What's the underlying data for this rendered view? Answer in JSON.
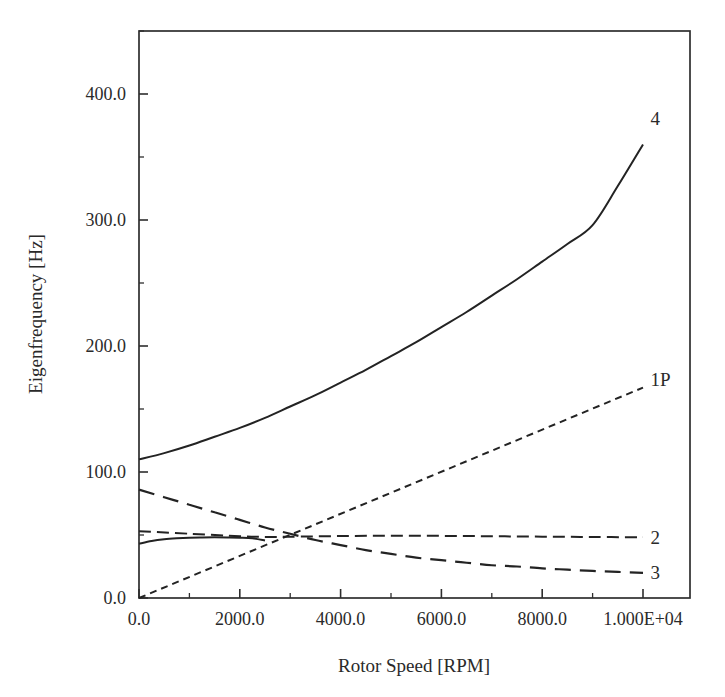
{
  "chart_data": {
    "type": "line",
    "title": "",
    "xlabel": "Rotor Speed [RPM]",
    "ylabel": "Eigenfrequency [Hz]",
    "xlim": [
      0,
      10500
    ],
    "ylim": [
      0,
      450
    ],
    "grid": false,
    "legend_position": "inline-right-end-labels",
    "xticks": [
      0,
      2000,
      4000,
      6000,
      8000,
      10000
    ],
    "xtick_labels": [
      "0.0",
      "2000.0",
      "4000.0",
      "6000.0",
      "8000.0",
      "1.000E+04"
    ],
    "xtick_minor_step": 1000,
    "yticks": [
      0,
      100,
      200,
      300,
      400
    ],
    "ytick_labels": [
      "0.0",
      "100.0",
      "200.0",
      "300.0",
      "400.0"
    ],
    "ytick_minor_step": 50,
    "series": [
      {
        "name": "4",
        "label": "4",
        "style": "solid",
        "x": [
          0,
          500,
          1000,
          1500,
          2000,
          2500,
          3000,
          3500,
          4000,
          4500,
          5000,
          5500,
          6000,
          6500,
          7000,
          7500,
          8000,
          8500,
          9000,
          9500,
          10000
        ],
        "values": [
          110,
          115,
          121,
          128,
          135,
          143,
          152,
          161,
          171,
          181,
          192,
          203,
          215,
          227,
          240,
          253,
          267,
          281,
          296,
          327,
          360
        ]
      },
      {
        "name": "1P",
        "label": "1P",
        "style": "dotted",
        "x": [
          0,
          10000
        ],
        "values": [
          0,
          167
        ]
      },
      {
        "name": "2",
        "label": "2",
        "style": "dashed-medium",
        "x": [
          0,
          1000,
          2000,
          2500,
          3000,
          4000,
          5000,
          6000,
          7000,
          8000,
          9000,
          10000
        ],
        "values": [
          53,
          51,
          49,
          48.5,
          48.6,
          49.2,
          49.4,
          49.3,
          49.0,
          48.7,
          48.4,
          48.2
        ]
      },
      {
        "name": "3",
        "label": "3",
        "style": "dashed-long",
        "x": [
          0,
          500,
          1000,
          1500,
          2000,
          2500,
          3000,
          3500,
          4000,
          4500,
          5000,
          5500,
          6000,
          6500,
          7000,
          7500,
          8000,
          8500,
          9000,
          9500,
          10000
        ],
        "values": [
          86,
          80,
          74,
          68,
          62,
          56,
          51,
          46,
          42,
          38,
          35,
          32,
          30,
          28,
          26,
          25,
          23.5,
          22.5,
          21.5,
          20.7,
          20
        ]
      },
      {
        "name": "lower-solid-branch",
        "label": "",
        "style": "solid",
        "x": [
          0,
          250,
          500,
          750,
          1000,
          1250,
          1500,
          1750,
          2000,
          2250,
          2500
        ],
        "values": [
          43,
          45.2,
          46.6,
          47.4,
          47.9,
          48.1,
          48.2,
          48.1,
          47.9,
          47.4,
          45.6
        ]
      }
    ],
    "annotations": [
      {
        "text": "4",
        "x": 10150,
        "y": 380
      },
      {
        "text": "1P",
        "x": 10150,
        "y": 173
      },
      {
        "text": "2",
        "x": 10150,
        "y": 48
      },
      {
        "text": "3",
        "x": 10150,
        "y": 20
      }
    ]
  }
}
